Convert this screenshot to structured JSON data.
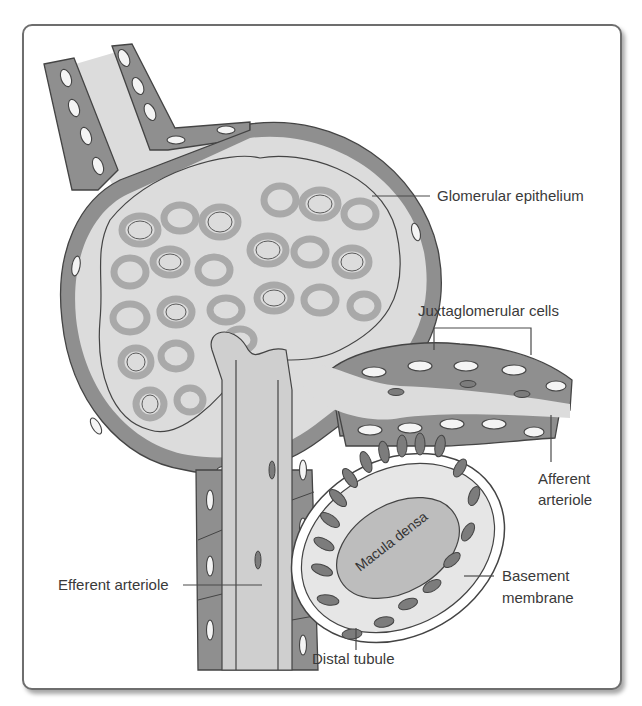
{
  "figure": {
    "labels": {
      "glomerular_epithelium": "Glomerular epithelium",
      "juxtaglomerular_cells": "Juxtaglomerular cells",
      "afferent_arteriole_line1": "Afferent",
      "afferent_arteriole_line2": "arteriole",
      "macula_densa": "Macula densa",
      "basement_membrane_line1": "Basement",
      "basement_membrane_line2": "membrane",
      "efferent_arteriole": "Efferent arteriole",
      "distal_tubule": "Distal tubule"
    },
    "colors": {
      "cell_wall": "#8f8f8f",
      "lumen": "#dcdcdc",
      "outline": "#444444",
      "label_text": "#3a3a3a",
      "frame_border": "#6e6e6e"
    }
  }
}
